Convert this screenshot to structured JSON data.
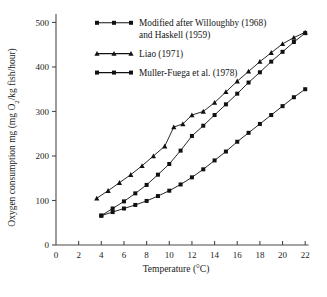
{
  "chart_data": {
    "type": "line",
    "title": "",
    "xlabel": "Temperature (°C)",
    "ylabel": "Oxygen consumption mg (mg O₂/kg fish/hour)",
    "xlim": [
      0,
      22.6
    ],
    "ylim": [
      0,
      510
    ],
    "xticks": [
      0,
      2,
      4,
      6,
      8,
      10,
      12,
      14,
      16,
      18,
      20,
      22
    ],
    "xtick_labels": [
      "0",
      "2",
      "4",
      "6",
      "8",
      "10",
      "12",
      "14",
      "16",
      "18",
      "20",
      "22"
    ],
    "yticks": [
      0,
      100,
      200,
      300,
      400,
      500
    ],
    "ytick_labels": [
      "0",
      "100",
      "200",
      "300",
      "400",
      "500"
    ],
    "grid": false,
    "legend_position": "top-left",
    "series": [
      {
        "name": "Modified after Willoughby (1968) and Haskell (1959)",
        "marker": "square",
        "x": [
          4.0,
          5.0,
          6.0,
          7.0,
          8.0,
          9.0,
          10.0,
          11.0,
          12.0,
          13.0,
          14.0,
          15.0,
          16.0,
          17.0,
          18.0,
          19.0,
          20.0,
          21.0,
          22.0
        ],
        "y": [
          66,
          82,
          98,
          116,
          135,
          158,
          182,
          212,
          245,
          268,
          292,
          316,
          340,
          365,
          388,
          412,
          434,
          456,
          476
        ]
      },
      {
        "name": "Liao (1971)",
        "marker": "triangle",
        "x": [
          3.6,
          4.6,
          5.6,
          6.6,
          7.6,
          8.6,
          9.6,
          10.4,
          11.2,
          12.0,
          13.0,
          14.0,
          15.0,
          16.0,
          17.0,
          18.0,
          19.0,
          20.0,
          21.0,
          22.0
        ],
        "y": [
          105,
          122,
          140,
          158,
          178,
          200,
          222,
          265,
          272,
          292,
          300,
          320,
          344,
          368,
          390,
          412,
          432,
          452,
          466,
          478
        ]
      },
      {
        "name": "Muller-Fuega et al. (1978)",
        "marker": "square",
        "x": [
          4.0,
          5.0,
          6.0,
          7.0,
          8.0,
          9.0,
          10.0,
          11.0,
          12.0,
          13.0,
          14.0,
          15.0,
          16.0,
          17.0,
          18.0,
          19.0,
          20.0,
          21.0,
          22.0
        ],
        "y": [
          66,
          74,
          82,
          90,
          99,
          110,
          122,
          136,
          152,
          170,
          190,
          210,
          232,
          252,
          272,
          292,
          312,
          332,
          350
        ]
      }
    ]
  },
  "legend": {
    "entries": [
      {
        "label_line1": "Modified after Willoughby (1968)",
        "label_line2": "and Haskell (1959)",
        "marker": "square"
      },
      {
        "label_line1": "Liao (1971)",
        "label_line2": "",
        "marker": "triangle"
      },
      {
        "label_line1": "Muller-Fuega et al. (1978)",
        "label_line2": "",
        "marker": "square"
      }
    ]
  },
  "colors": {
    "ink": "#111111",
    "axis": "#4a4a4a",
    "background": "#ffffff"
  }
}
